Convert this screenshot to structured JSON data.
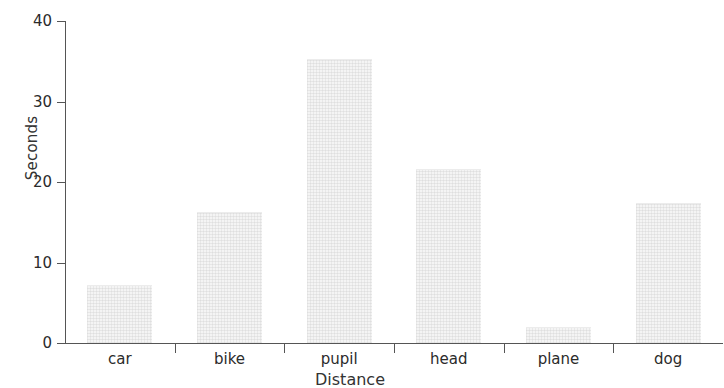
{
  "chart_data": {
    "type": "bar",
    "title": "",
    "xlabel": "Distance",
    "ylabel": "Seconds",
    "categories": [
      "car",
      "bike",
      "pupil",
      "head",
      "plane",
      "dog"
    ],
    "values": [
      7.2,
      16.3,
      35.3,
      21.6,
      2.0,
      17.4
    ],
    "ylim": [
      0,
      40
    ],
    "ytick_labels": [
      "0",
      "10",
      "20",
      "30",
      "40"
    ],
    "ytick_values": [
      0,
      10,
      20,
      30,
      40
    ],
    "grid": false,
    "legend": null,
    "bar_color": "#f4f4f4",
    "axis_color": "#555555",
    "text_color": "#2b2b2b"
  }
}
